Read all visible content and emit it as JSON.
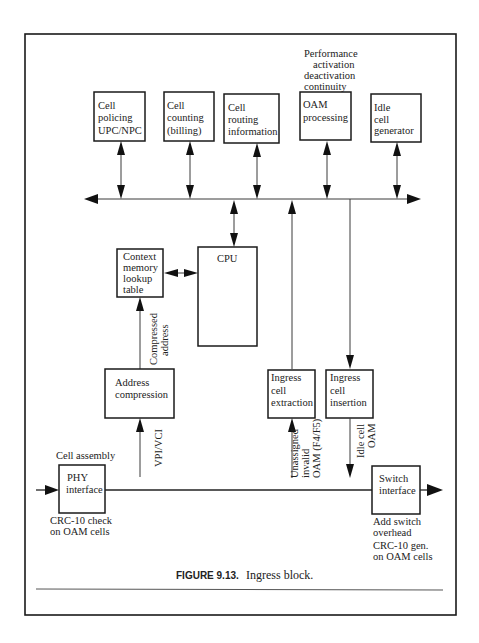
{
  "figure": {
    "caption_label": "FIGURE 9.13.",
    "caption_text": "Ingress block."
  },
  "top_note": [
    "Performance",
    "activation",
    "deactivation",
    "continuity"
  ],
  "boxes": {
    "cell_policing": [
      "Cell",
      "policing",
      "UPC/NPC"
    ],
    "cell_counting": [
      "Cell",
      "counting",
      "(billing)"
    ],
    "cell_routing": [
      "Cell",
      "routing",
      "information"
    ],
    "oam_processing": [
      "OAM",
      "processing"
    ],
    "idle_cell_generator": [
      "Idle",
      "cell",
      "generator"
    ],
    "context_memory": [
      "Context",
      "memory",
      "lookup",
      "table"
    ],
    "cpu": [
      "CPU"
    ],
    "address_compression": [
      "Address",
      "compression"
    ],
    "ingress_extraction": [
      "Ingress",
      "cell",
      "extraction"
    ],
    "ingress_insertion": [
      "Ingress",
      "cell",
      "insertion"
    ],
    "phy_interface": [
      "PHY",
      "interface"
    ],
    "switch_interface": [
      "Switch",
      "interface"
    ]
  },
  "labels": {
    "cell_assembly": "Cell assembly",
    "phy_note": [
      "CRC-10 check",
      "on OAM cells"
    ],
    "switch_note_1": [
      "Add switch",
      "overhead"
    ],
    "switch_note_2": [
      "CRC-10 gen.",
      "on OAM cells"
    ],
    "compressed_address": [
      "Compressed",
      "address"
    ],
    "vpi_vci": "VPI/VCI",
    "unassigned": [
      "Unassigned",
      "invalid",
      "OAM (F4/F5)"
    ],
    "idle_oam": [
      "Idle cell",
      "OAM"
    ]
  }
}
